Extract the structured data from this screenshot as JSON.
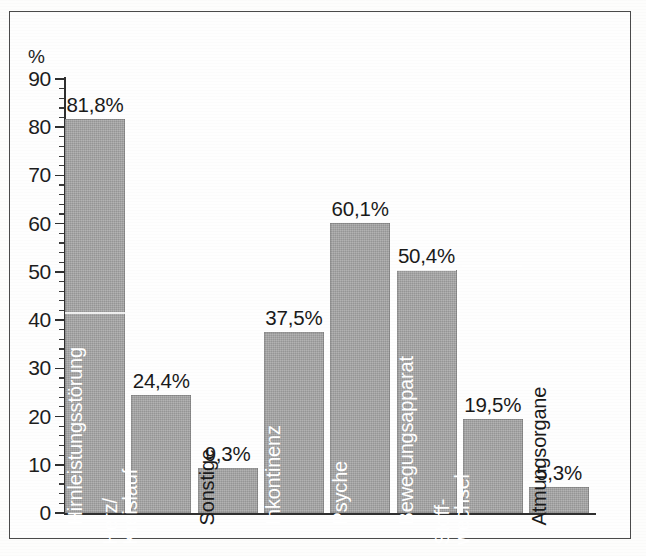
{
  "chart_data": {
    "type": "bar",
    "title": "",
    "subtitle": "",
    "xlabel": "",
    "ylabel": "%",
    "ylim": [
      0,
      90
    ],
    "ytick_step": 10,
    "yminor_step": 2,
    "grid": false,
    "legend": "none",
    "value_suffix": "%",
    "decimal_separator": ",",
    "categories": [
      "Hirnleistungsstörung",
      "Herz/\nKreislauf",
      "Sonstige",
      "Inkontinenz",
      "Psyche",
      "Bewegungsapparat",
      "Stoff-\nwechsel",
      "Atmungsorgane"
    ],
    "values": [
      81.8,
      24.4,
      9.3,
      37.5,
      60.1,
      50.4,
      19.5,
      5.3
    ],
    "value_labels": [
      "81,8%",
      "24,4%",
      "9,3%",
      "37,5%",
      "60,1%",
      "50,4%",
      "19,5%",
      "5,3%"
    ],
    "ytick_labels": [
      "90",
      "80",
      "70",
      "60",
      "50",
      "40",
      "30",
      "20",
      "10",
      "0"
    ],
    "ytick_values": [
      90,
      80,
      70,
      60,
      50,
      40,
      30,
      20,
      10,
      0
    ],
    "bars": [
      {
        "label": "Hirnleistungsstörung",
        "value": 81.8,
        "value_label": "81,8%",
        "label_lines": [
          "Hirnleistungsstörung"
        ],
        "label_placement": "inside",
        "label_color": "#ffffff"
      },
      {
        "label": "Herz/Kreislauf",
        "value": 24.4,
        "value_label": "24,4%",
        "label_lines": [
          "Herz/",
          "Kreislauf"
        ],
        "label_placement": "inside",
        "label_color": "#ffffff"
      },
      {
        "label": "Sonstige",
        "value": 9.3,
        "value_label": "9,3%",
        "label_lines": [
          "Sonstige"
        ],
        "label_placement": "outside",
        "label_color": "#1a1a1a"
      },
      {
        "label": "Inkontinenz",
        "value": 37.5,
        "value_label": "37,5%",
        "label_lines": [
          "Inkontinenz"
        ],
        "label_placement": "inside",
        "label_color": "#ffffff"
      },
      {
        "label": "Psyche",
        "value": 60.1,
        "value_label": "60,1%",
        "label_lines": [
          "Psyche"
        ],
        "label_placement": "inside",
        "label_color": "#ffffff"
      },
      {
        "label": "Bewegungsapparat",
        "value": 50.4,
        "value_label": "50,4%",
        "label_lines": [
          "Bewegungsapparat"
        ],
        "label_placement": "inside",
        "label_color": "#ffffff"
      },
      {
        "label": "Stoffwechsel",
        "value": 19.5,
        "value_label": "19,5%",
        "label_lines": [
          "Stoff-",
          "wechsel"
        ],
        "label_placement": "inside",
        "label_color": "#ffffff"
      },
      {
        "label": "Atmungsorgane",
        "value": 5.3,
        "value_label": "5,3%",
        "label_lines": [
          "Atmungsorgane"
        ],
        "label_placement": "outside",
        "label_color": "#1a1a1a"
      }
    ],
    "colors": {
      "bar_fill": "#a3a3a3",
      "axis": "#2f2f2f",
      "text": "#1a1a1a",
      "inside_label": "#ffffff",
      "frame": "#4a4a4a",
      "background": "#fefefe"
    }
  },
  "axis": {
    "y_unit_label": "%"
  }
}
